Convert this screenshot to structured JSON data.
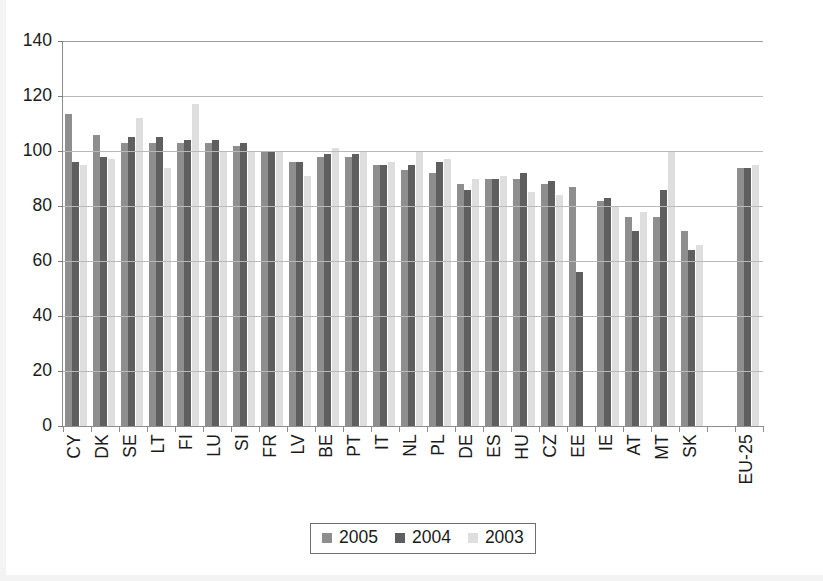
{
  "chart_data": {
    "type": "bar",
    "title": "",
    "subtitle": "",
    "xlabel": "",
    "ylabel": "",
    "ylim": [
      0,
      140
    ],
    "yticks": [
      0,
      20,
      40,
      60,
      80,
      100,
      120,
      140
    ],
    "ytick_labels": [
      "0",
      "20",
      "40",
      "60",
      "80",
      "100",
      "120",
      "140"
    ],
    "grid": true,
    "grid_axis": "y",
    "legend_position": "bottom-center",
    "legend": [
      "2005",
      "2004",
      "2003"
    ],
    "series_colors": [
      "#8e8e8e",
      "#5f5f5f",
      "#dedede"
    ],
    "categories": [
      "CY",
      "DK",
      "SE",
      "LT",
      "FI",
      "LU",
      "SI",
      "FR",
      "LV",
      "BE",
      "PT",
      "IT",
      "NL",
      "PL",
      "DE",
      "ES",
      "HU",
      "CZ",
      "EE",
      "IE",
      "AT",
      "MT",
      "SK",
      "",
      "EU-25"
    ],
    "series": [
      {
        "name": "2005",
        "values": [
          113.5,
          106,
          103,
          103,
          103,
          103,
          102,
          100,
          96,
          98,
          98,
          95,
          93,
          92,
          88,
          90,
          90,
          88,
          87,
          82,
          76,
          76,
          71,
          null,
          94
        ]
      },
      {
        "name": "2004",
        "values": [
          96,
          98,
          105,
          105,
          104,
          104,
          103,
          100,
          96,
          99,
          99,
          95,
          95,
          96,
          86,
          90,
          92,
          89,
          56,
          83,
          71,
          86,
          64,
          null,
          94
        ]
      },
      {
        "name": "2003",
        "values": [
          95,
          97,
          112,
          94,
          117,
          100,
          100,
          100,
          91,
          101,
          100,
          96,
          100,
          97,
          90,
          91,
          85,
          84,
          null,
          80,
          78,
          100,
          66,
          null,
          95
        ]
      }
    ]
  },
  "axis": {
    "y_tick_labels": [
      "140",
      "120",
      "100",
      "80",
      "60",
      "40",
      "20",
      "0"
    ],
    "x_tick_labels": [
      "CY",
      "DK",
      "SE",
      "LT",
      "FI",
      "LU",
      "SI",
      "FR",
      "LV",
      "BE",
      "PT",
      "IT",
      "NL",
      "PL",
      "DE",
      "ES",
      "HU",
      "CZ",
      "EE",
      "IE",
      "AT",
      "MT",
      "SK",
      "EU-25"
    ]
  },
  "legend": {
    "items": [
      {
        "label": "2005",
        "color": "#8e8e8e",
        "swatch": "legend-swatch-2005"
      },
      {
        "label": "2004",
        "color": "#5f5f5f",
        "swatch": "legend-swatch-2004"
      },
      {
        "label": "2003",
        "color": "#dedede",
        "swatch": "legend-swatch-2003"
      }
    ]
  }
}
